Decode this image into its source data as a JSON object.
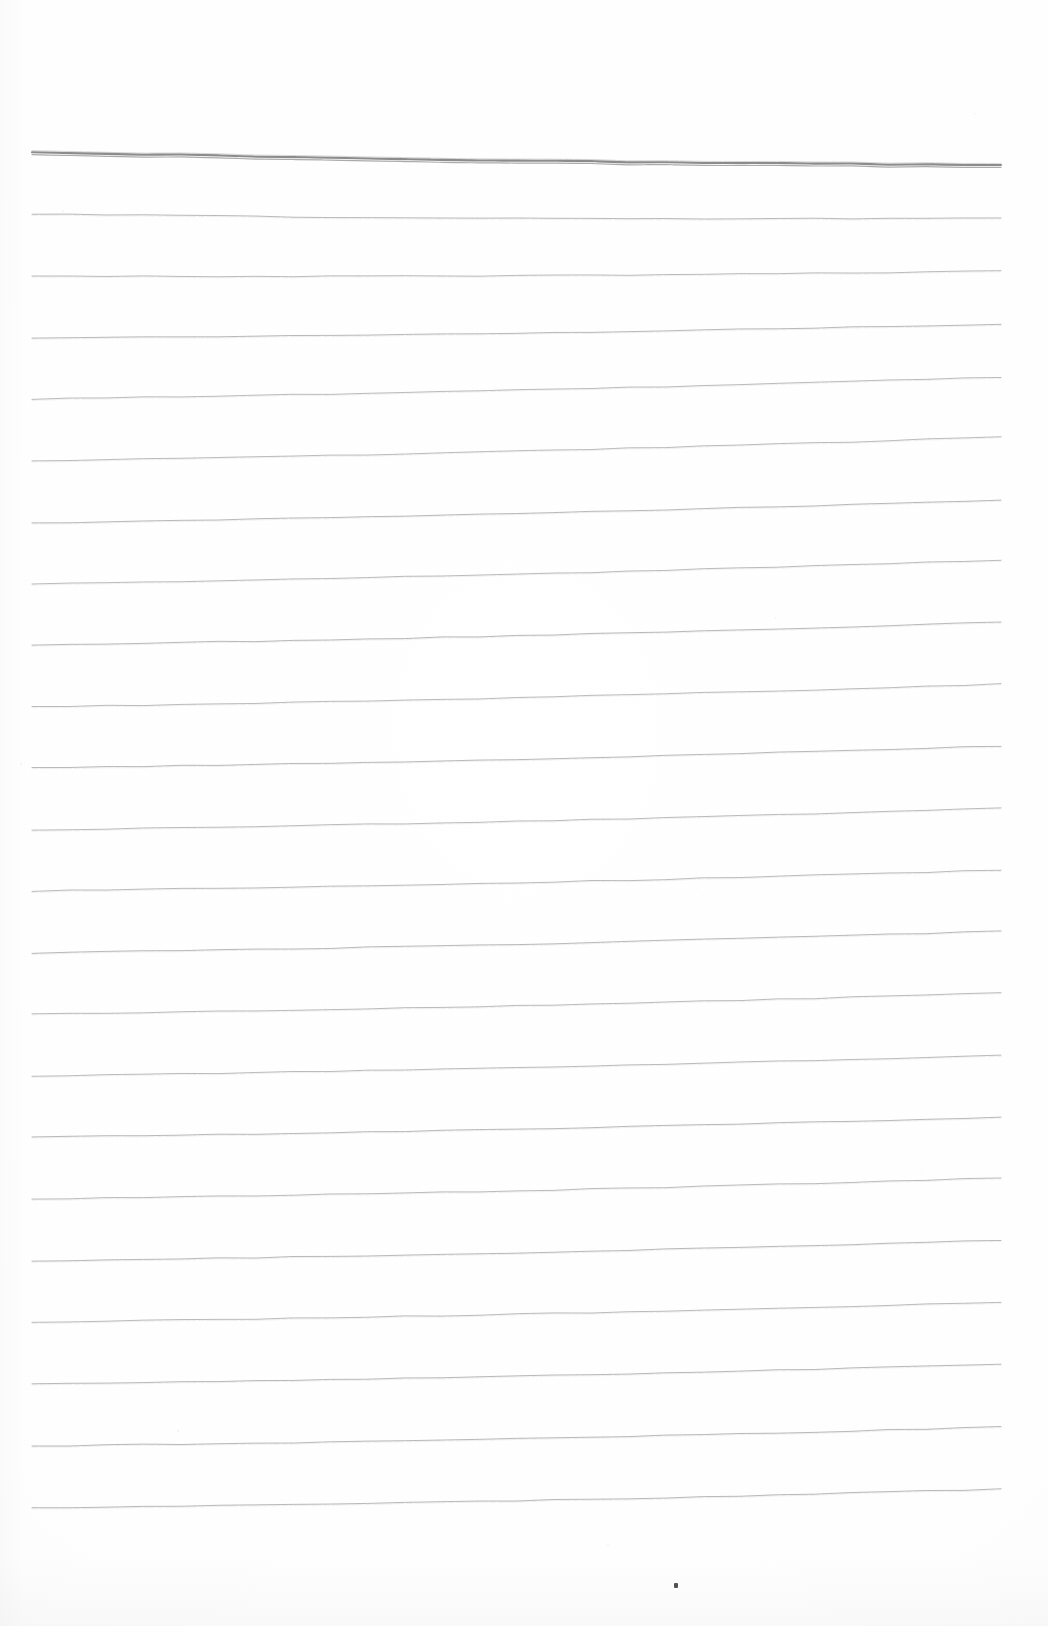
{
  "document": {
    "kind": "scanned-lined-paper",
    "title": "",
    "visible_text": "",
    "page_width": 1048,
    "page_height": 1626,
    "background_color": "#fefefe",
    "notes": "Blank ruled notebook page, no handwriting or printed text visible"
  },
  "ruling": {
    "line_color": "#8e8e8e",
    "header_line_color": "#6f6f6f",
    "line_count": 23,
    "line_spacing_px": 61.5,
    "left_x": 32,
    "right_x": 1001,
    "first_line_y": 152,
    "last_line_y": 1530,
    "header_line_is_double": true,
    "lines": [
      {
        "index": 1,
        "y_left": 152,
        "y_right": 165,
        "weight": 2.1,
        "opacity": 0.8,
        "header": true
      },
      {
        "index": 2,
        "y_left": 214,
        "y_right": 218,
        "weight": 1.0,
        "opacity": 0.62,
        "header": false
      },
      {
        "index": 3,
        "y_left": 276,
        "y_right": 271,
        "weight": 1.0,
        "opacity": 0.6,
        "header": false
      },
      {
        "index": 4,
        "y_left": 338,
        "y_right": 324,
        "weight": 1.0,
        "opacity": 0.62,
        "header": false
      },
      {
        "index": 5,
        "y_left": 399,
        "y_right": 377,
        "weight": 1.0,
        "opacity": 0.6,
        "header": false
      },
      {
        "index": 6,
        "y_left": 461,
        "y_right": 437,
        "weight": 1.0,
        "opacity": 0.6,
        "header": false
      },
      {
        "index": 7,
        "y_left": 523,
        "y_right": 500,
        "weight": 1.0,
        "opacity": 0.62,
        "header": false
      },
      {
        "index": 8,
        "y_left": 584,
        "y_right": 560,
        "weight": 1.0,
        "opacity": 0.6,
        "header": false
      },
      {
        "index": 9,
        "y_left": 645,
        "y_right": 622,
        "weight": 1.0,
        "opacity": 0.62,
        "header": false
      },
      {
        "index": 10,
        "y_left": 707,
        "y_right": 684,
        "weight": 1.0,
        "opacity": 0.6,
        "header": false
      },
      {
        "index": 11,
        "y_left": 768,
        "y_right": 746,
        "weight": 1.0,
        "opacity": 0.62,
        "header": false
      },
      {
        "index": 12,
        "y_left": 830,
        "y_right": 808,
        "weight": 1.0,
        "opacity": 0.6,
        "header": false
      },
      {
        "index": 13,
        "y_left": 891,
        "y_right": 870,
        "weight": 1.0,
        "opacity": 0.6,
        "header": false
      },
      {
        "index": 14,
        "y_left": 953,
        "y_right": 931,
        "weight": 1.0,
        "opacity": 0.62,
        "header": false
      },
      {
        "index": 15,
        "y_left": 1014,
        "y_right": 993,
        "weight": 1.0,
        "opacity": 0.6,
        "header": false
      },
      {
        "index": 16,
        "y_left": 1076,
        "y_right": 1055,
        "weight": 1.0,
        "opacity": 0.6,
        "header": false
      },
      {
        "index": 17,
        "y_left": 1137,
        "y_right": 1117,
        "weight": 1.0,
        "opacity": 0.62,
        "header": false
      },
      {
        "index": 18,
        "y_left": 1199,
        "y_right": 1178,
        "weight": 1.0,
        "opacity": 0.6,
        "header": false
      },
      {
        "index": 19,
        "y_left": 1261,
        "y_right": 1240,
        "weight": 1.0,
        "opacity": 0.62,
        "header": false
      },
      {
        "index": 20,
        "y_left": 1322,
        "y_right": 1302,
        "weight": 1.0,
        "opacity": 0.6,
        "header": false
      },
      {
        "index": 21,
        "y_left": 1384,
        "y_right": 1364,
        "weight": 1.0,
        "opacity": 0.62,
        "header": false
      },
      {
        "index": 22,
        "y_left": 1446,
        "y_right": 1427,
        "weight": 1.0,
        "opacity": 0.62,
        "header": false
      },
      {
        "index": 23,
        "y_left": 1508,
        "y_right": 1489,
        "weight": 1.0,
        "opacity": 0.62,
        "header": false
      }
    ]
  },
  "artifacts": {
    "specks": [
      {
        "name": "dust-speck",
        "x": 674,
        "y": 1583,
        "w": 4,
        "h": 5
      }
    ]
  }
}
